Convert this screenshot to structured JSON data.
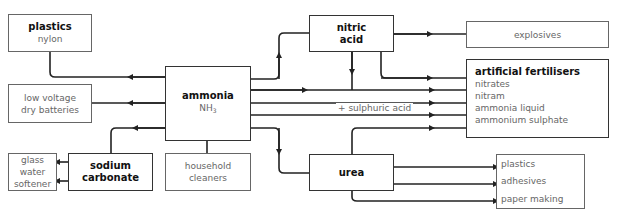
{
  "diagram": {
    "center": {
      "name": "ammonia",
      "formula": "NH",
      "formula_sub": "3"
    },
    "nodes": {
      "plastics_nylon": {
        "title": "plastics",
        "sub": "nylon"
      },
      "low_voltage": {
        "line1": "low voltage",
        "line2": "dry batteries"
      },
      "glass_water": {
        "line1": "glass",
        "line2": "water",
        "line3": "softener"
      },
      "sodium_carbonate": {
        "line1": "sodium",
        "line2": "carbonate"
      },
      "household": {
        "line1": "household",
        "line2": "cleaners"
      },
      "nitric_acid": {
        "line1": "nitric",
        "line2": "acid"
      },
      "explosives": {
        "label": "explosives"
      },
      "fertilisers": {
        "title": "artificial fertilisers",
        "items": [
          "nitrates",
          "nitram",
          "ammonia liquid",
          "ammonium sulphate"
        ]
      },
      "urea": {
        "label": "urea"
      },
      "urea_uses": {
        "items": [
          "plastics",
          "adhesives",
          "paper making"
        ]
      }
    },
    "edge_labels": {
      "sulphuric": "+ sulphuric acid"
    },
    "colors": {
      "line": "#222222",
      "border": "#666666",
      "bold_text": "#111111",
      "text": "#666666"
    }
  }
}
